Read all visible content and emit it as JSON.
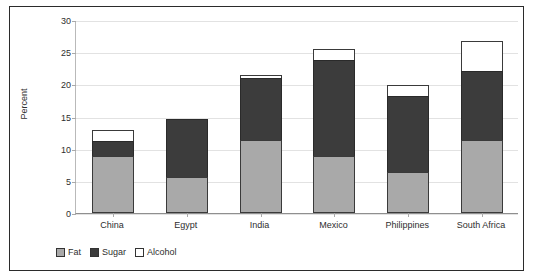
{
  "chart_data": {
    "type": "bar",
    "title": "",
    "xlabel": "",
    "ylabel": "Percent",
    "ylim": [
      0,
      30
    ],
    "yticks": [
      0,
      5,
      10,
      15,
      20,
      25,
      30
    ],
    "grid": true,
    "stacked": true,
    "legend_position": "bottom-left",
    "categories": [
      "China",
      "Egypt",
      "India",
      "Mexico",
      "Philippines",
      "South Africa"
    ],
    "series": [
      {
        "name": "Fat",
        "color": "#a9a9a9",
        "values": [
          8.8,
          5.6,
          11.4,
          8.8,
          6.4,
          11.4
        ]
      },
      {
        "name": "Sugar",
        "color": "#3c3c3c",
        "values": [
          2.6,
          9.2,
          9.8,
          15.1,
          11.9,
          10.8
        ]
      },
      {
        "name": "Alcohol",
        "color": "#ffffff",
        "values": [
          1.8,
          0.0,
          0.5,
          1.9,
          1.9,
          4.9
        ]
      }
    ],
    "totals": [
      13.2,
      14.8,
      21.7,
      25.8,
      20.2,
      27.1
    ]
  },
  "legend": {
    "items": [
      {
        "label": "Fat"
      },
      {
        "label": "Sugar"
      },
      {
        "label": "Alcohol"
      }
    ]
  },
  "axis": {
    "y_title": "Percent",
    "y_tick_labels": [
      "30",
      "25",
      "20",
      "15",
      "10",
      "5",
      "0"
    ]
  }
}
